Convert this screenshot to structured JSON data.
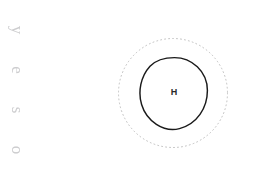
{
  "document": {
    "background_color": "#ffffff",
    "width": 254,
    "height": 171
  },
  "margin_text": {
    "reading": "osey",
    "orientation": "rotated-90-clockwise",
    "color": "#c9c9cb",
    "characters": [
      "y",
      "e",
      "s",
      "o"
    ]
  },
  "diagram": {
    "name": "concentric-circle-diagram",
    "outer_ring": {
      "style": "dotted",
      "color": "#bfbfbf",
      "center_x": 173,
      "center_y": 93,
      "diameter": 110
    },
    "inner_circle": {
      "style": "solid",
      "color": "#1a1a1a",
      "center_x": 174,
      "center_y": 93,
      "diameter": 70,
      "label": "H"
    }
  }
}
